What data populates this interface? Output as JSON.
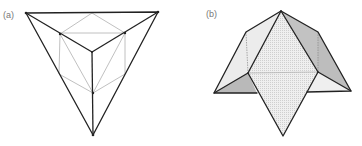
{
  "figures": [
    {
      "id": "a",
      "label": "(a)",
      "description": "Tetrahedron with inscribed hexagon and central vertex (projection)"
    },
    {
      "id": "b",
      "label": "(b)",
      "description": "Polyhedron net with shaded folded faces"
    }
  ],
  "colors": {
    "bold_edge": "#222222",
    "thin_edge": "#b0b0b0",
    "face_light": "#ededed",
    "face_dotted": "#e4e4e4",
    "face_dark": "#b8b8b8",
    "face_mid": "#d6d6d6",
    "label": "#777777"
  }
}
